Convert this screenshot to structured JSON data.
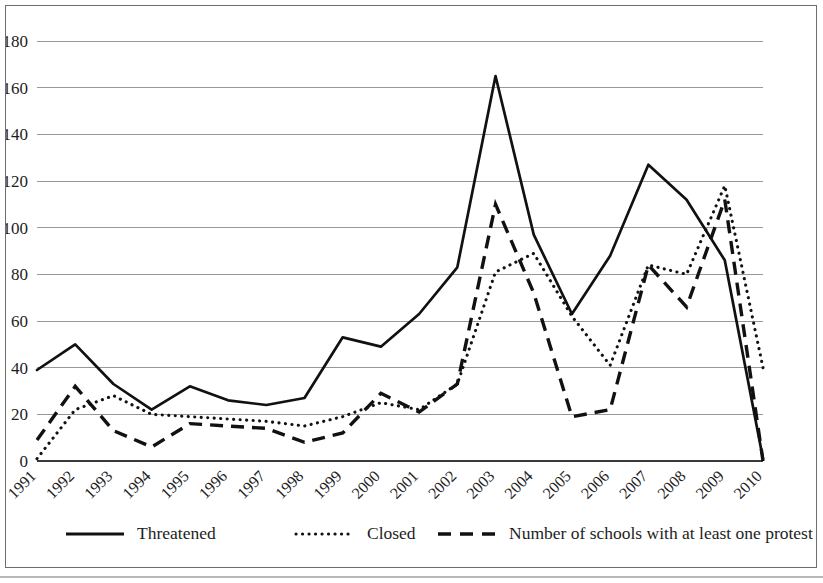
{
  "chart_data": {
    "type": "line",
    "title": "",
    "subtitle": "",
    "xlabel": "",
    "ylabel": "",
    "grid": true,
    "legend_position": "bottom",
    "xlim": [
      "1991",
      "2010"
    ],
    "ylim": [
      0,
      180
    ],
    "y_ticks": [
      0,
      20,
      40,
      60,
      80,
      100,
      120,
      140,
      160,
      180
    ],
    "categories": [
      "1991",
      "1992",
      "1993",
      "1994",
      "1995",
      "1996",
      "1997",
      "1998",
      "1999",
      "2000",
      "2001",
      "2002",
      "2003",
      "2004",
      "2005",
      "2006",
      "2007",
      "2008",
      "2009",
      "2010"
    ],
    "series": [
      {
        "name": "Threatened",
        "style": "solid",
        "values": [
          39,
          50,
          33,
          22,
          32,
          26,
          24,
          27,
          53,
          49,
          63,
          83,
          165,
          97,
          63,
          88,
          127,
          112,
          86,
          1
        ]
      },
      {
        "name": "Closed",
        "style": "dotted",
        "values": [
          1,
          22,
          28,
          20,
          19,
          18,
          17,
          15,
          19,
          25,
          22,
          33,
          81,
          89,
          62,
          41,
          84,
          80,
          118,
          40
        ]
      },
      {
        "name": "Number of schools with at least one protest",
        "style": "dashed",
        "values": [
          9,
          32,
          13,
          6,
          16,
          15,
          14,
          8,
          12,
          29,
          21,
          33,
          110,
          72,
          19,
          22,
          84,
          66,
          112,
          0
        ]
      }
    ]
  },
  "legend": {
    "items": [
      {
        "label": "Threatened",
        "style": "solid"
      },
      {
        "label": "Closed",
        "style": "dotted"
      },
      {
        "label": "Number of schools with at least one protest",
        "style": "dashed"
      }
    ]
  }
}
